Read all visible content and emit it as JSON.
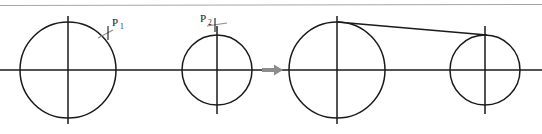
{
  "figure": {
    "title": "",
    "background_color": "#ffffff",
    "stroke_color": "#1a1a1a",
    "accent_color": "#8c8c8c",
    "top_rule_color": "#a6a6a6",
    "labels": {
      "p1_base": "P",
      "p1_sub": "1",
      "p2_base": "P",
      "p2_sub": "2"
    },
    "geometry": {
      "top_rule_y": 5,
      "axis_y": 70,
      "circles": [
        {
          "name": "left-stage-large-circle",
          "cx": 68,
          "cy": 70,
          "r": 48
        },
        {
          "name": "left-stage-small-circle",
          "cx": 217,
          "cy": 70,
          "r": 35
        },
        {
          "name": "right-stage-large-circle",
          "cx": 337,
          "cy": 70,
          "r": 48
        },
        {
          "name": "right-stage-small-circle",
          "cx": 485,
          "cy": 70,
          "r": 35
        }
      ],
      "arrow": {
        "x1": 262,
        "x2": 282,
        "y": 70
      },
      "tangent": {
        "x1": 337,
        "y1": 22,
        "x2": 485,
        "y2": 35
      },
      "marker_p1": {
        "x": 104,
        "y": 30
      },
      "marker_p2": {
        "x": 215,
        "y": 25
      }
    }
  }
}
